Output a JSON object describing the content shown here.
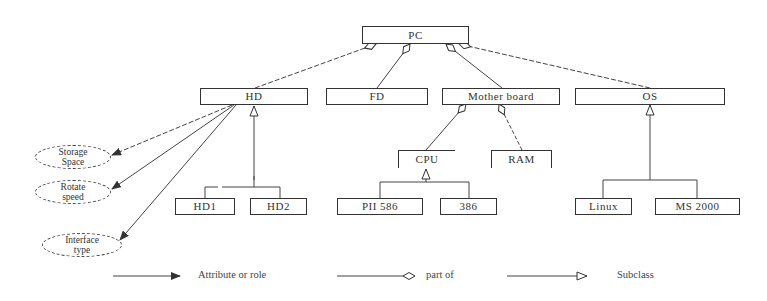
{
  "diagram": {
    "root": {
      "label": "PC"
    },
    "components": [
      {
        "id": "hd",
        "label": "HD"
      },
      {
        "id": "fd",
        "label": "FD"
      },
      {
        "id": "motherboard",
        "label": "Mother board"
      },
      {
        "id": "os",
        "label": "OS"
      }
    ],
    "motherboard_parts": [
      {
        "id": "cpu",
        "label": "CPU"
      },
      {
        "id": "ram",
        "label": "RAM"
      }
    ],
    "hd_subclasses": [
      {
        "id": "hd1",
        "label": "HD1"
      },
      {
        "id": "hd2",
        "label": "HD2"
      }
    ],
    "cpu_subclasses": [
      {
        "id": "pii586",
        "label": "PII 586"
      },
      {
        "id": "386",
        "label": "386"
      }
    ],
    "os_subclasses": [
      {
        "id": "linux",
        "label": "Linux"
      },
      {
        "id": "ms2000",
        "label": "MS 2000"
      }
    ],
    "hd_attributes": [
      {
        "line1": "Storage",
        "line2": "Space"
      },
      {
        "line1": "Rotate",
        "line2": "speed"
      },
      {
        "line1": "Interface",
        "line2": "type"
      }
    ]
  },
  "legend": {
    "attribute": "Attribute or role",
    "part_of": "part of",
    "subclass": "Subclass"
  }
}
